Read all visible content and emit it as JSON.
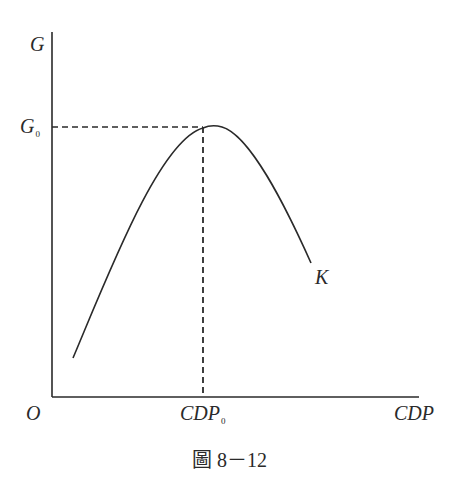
{
  "figure": {
    "caption": "圖 8－12",
    "y_axis_label": "G",
    "x_axis_label": "CDP",
    "origin_label": "O",
    "y_marker_label": "G",
    "y_marker_sub": "0",
    "x_marker_label": "CDP",
    "x_marker_sub": "0",
    "curve_label": "K"
  },
  "colors": {
    "line": "#2a2a2a",
    "background": "#ffffff"
  },
  "geometry": {
    "origin": [
      52,
      397
    ],
    "y_axis_top": [
      52,
      32
    ],
    "x_axis_end": [
      419,
      397
    ],
    "peak": [
      212,
      126
    ],
    "curve_start": [
      73,
      358
    ],
    "curve_end": [
      311,
      263
    ],
    "dashed_intersection": [
      203,
      127
    ]
  }
}
